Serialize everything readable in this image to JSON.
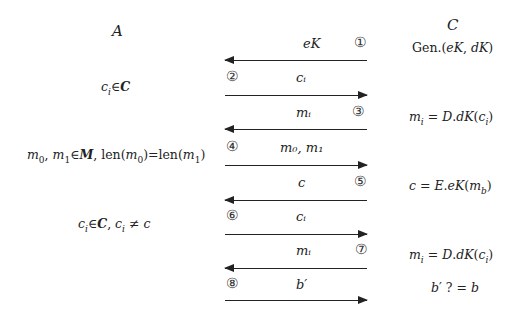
{
  "parties": {
    "left": "A",
    "right": "C"
  },
  "left_notes": [
    {
      "id": "ci-in-C",
      "text": "cᵢ∈C"
    },
    {
      "id": "m0-m1",
      "text": "m₀, m₁∈M, len(m₀)=len(m₁)"
    },
    {
      "id": "ci-neq-c",
      "text": "cᵢ∈C, cᵢ ≠ c"
    }
  ],
  "right_notes": [
    {
      "id": "gen",
      "text": "Gen.(eK, dK)"
    },
    {
      "id": "decrypt1",
      "text": "mᵢ = D.dK(cᵢ)"
    },
    {
      "id": "encrypt",
      "text": "c = E.eK(m_b)"
    },
    {
      "id": "decrypt2",
      "text": "mᵢ = D.dK(cᵢ)"
    },
    {
      "id": "guess",
      "text": "b′ ? = b"
    }
  ],
  "messages": [
    {
      "step": "①",
      "label": "eK",
      "direction": "left"
    },
    {
      "step": "②",
      "label": "cᵢ",
      "direction": "right"
    },
    {
      "step": "③",
      "label": "mᵢ",
      "direction": "left"
    },
    {
      "step": "④",
      "label": "m₀, m₁",
      "direction": "right"
    },
    {
      "step": "⑤",
      "label": "c",
      "direction": "left"
    },
    {
      "step": "⑥",
      "label": "cᵢ",
      "direction": "right"
    },
    {
      "step": "⑦",
      "label": "mᵢ",
      "direction": "left"
    },
    {
      "step": "⑧",
      "label": "b′",
      "direction": "right"
    }
  ]
}
